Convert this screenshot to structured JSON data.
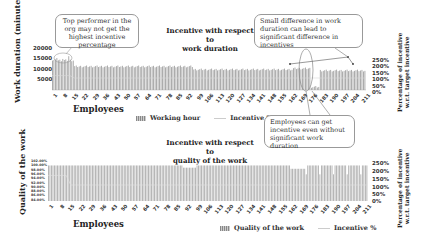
{
  "chart_data": [
    {
      "type": "bar",
      "title": "Incentive with respect to work duration",
      "xlabel": "Employees",
      "ylabel": "Work duration (minutes)",
      "ylabel_right": "Percentage of incentive w.r.t. target incentive",
      "ylim": [
        0,
        20000
      ],
      "ylim_right": [
        0,
        2.5
      ],
      "yticks": [
        "20000",
        "15000",
        "10000",
        "5000",
        "0"
      ],
      "yticks_right": [
        "250%",
        "200%",
        "150%",
        "100%",
        "50%",
        "0%"
      ],
      "xticks": [
        "1",
        "8",
        "15",
        "22",
        "29",
        "36",
        "43",
        "50",
        "57",
        "64",
        "71",
        "78",
        "85",
        "92",
        "99",
        "106",
        "113",
        "120",
        "127",
        "134",
        "141",
        "148",
        "155",
        "162",
        "169",
        "176",
        "183",
        "190",
        "197",
        "204",
        "211"
      ],
      "legend": [
        "Working hour",
        "Incentive %"
      ],
      "legend_position": "bottom",
      "grid": false,
      "series": [
        {
          "name": "Working hour",
          "type": "bar",
          "approx_profile": [
            {
              "range": "1-15",
              "value": 14500,
              "peak": 16500
            },
            {
              "range": "16-95",
              "value": 11500
            },
            {
              "range": "96-162",
              "value": 10000
            },
            {
              "range": "163-174",
              "value": 10500
            },
            {
              "range": "175-180",
              "value": 1500
            },
            {
              "range": "181-211",
              "value": 9500
            }
          ]
        },
        {
          "name": "Incentive %",
          "type": "line",
          "approx_profile": [
            {
              "range": "1-15",
              "value": 1.2
            },
            {
              "range": "16-211",
              "value": 1.0
            }
          ]
        }
      ]
    },
    {
      "type": "bar",
      "title": "Incentive with respect to quality of the work",
      "xlabel": "Employees",
      "ylabel": "Quality of the work",
      "ylabel_right": "Percentage of incentive w.r.t. target incentive",
      "ylim": [
        0.84,
        1.02
      ],
      "ylim_right": [
        0,
        2.5
      ],
      "yticks": [
        "102.00%",
        "100.00%",
        "98.00%",
        "96.00%",
        "94.00%",
        "92.00%",
        "90.00%",
        "88.00%",
        "86.00%",
        "84.00%"
      ],
      "yticks_right": [
        "250%",
        "200%",
        "150%",
        "100%",
        "50%",
        "0%"
      ],
      "xticks": [
        "1",
        "8",
        "15",
        "22",
        "29",
        "36",
        "43",
        "50",
        "57",
        "64",
        "71",
        "78",
        "85",
        "92",
        "99",
        "106",
        "113",
        "120",
        "127",
        "134",
        "141",
        "148",
        "155",
        "162",
        "169",
        "176",
        "183",
        "190",
        "197",
        "204",
        "211"
      ],
      "legend": [
        "Quality of the work",
        "Incentive %"
      ],
      "legend_position": "bottom",
      "grid": false,
      "series": [
        {
          "name": "Quality of the work",
          "type": "bar",
          "approx_profile": [
            {
              "range": "1-89",
              "value": 1.0
            },
            {
              "range": "90-98",
              "value": 0.99
            },
            {
              "range": "99-160",
              "value": 1.0
            },
            {
              "range": "161-170",
              "value": 0.985
            },
            {
              "range": "171-211",
              "value": 1.0,
              "dips_to": 0.96
            }
          ]
        },
        {
          "name": "Incentive %",
          "type": "line",
          "approx_profile": [
            {
              "range": "1-15",
              "value": 1.6
            },
            {
              "range": "16-211",
              "value": 1.0
            }
          ]
        }
      ]
    }
  ],
  "annotations": {
    "top_left": "Top performer in the org may not get the highest incentive percentage",
    "top_right": "Small difference in work duration can lead to significant difference in incentives",
    "middle": "Employees can get incentive even without significant work duration"
  },
  "labels": {
    "top_title_1": "Incentive with respect to",
    "top_title_2": "work duration",
    "bottom_title_1": "Incentive with respect to",
    "bottom_title_2": "quality of the work",
    "ylabel_top": "Work duration (minutes)",
    "ylabel_bottom": "Quality of the work",
    "ylabel_right_1": "Percentage of incentive",
    "ylabel_right_2": "w.r.t. target incentive",
    "xlabel": "Employees",
    "legend_top_bar": "Working hour",
    "legend_top_line": "Incentive %",
    "legend_bottom_bar": "Quality of the work",
    "legend_bottom_line": "Incentive %"
  }
}
